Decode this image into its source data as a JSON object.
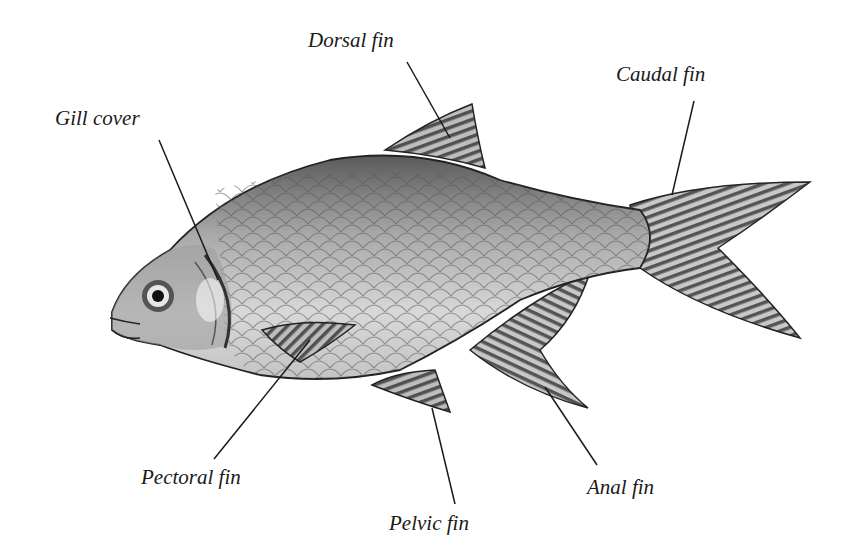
{
  "diagram": {
    "labels": {
      "dorsal": "Dorsal fin",
      "caudal": "Caudal fin",
      "gill": "Gill cover",
      "pectoral": "Pectoral fin",
      "pelvic": "Pelvic fin",
      "anal": "Anal fin"
    }
  }
}
